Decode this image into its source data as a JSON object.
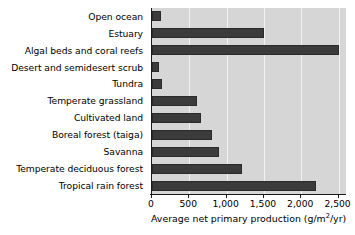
{
  "chart_data": {
    "type": "bar",
    "orientation": "horizontal",
    "title": "",
    "xlabel": "Average net primary production (g/m2/yr)",
    "ylabel": "",
    "categories": [
      "Open ocean",
      "Estuary",
      "Algal beds and coral reefs",
      "Desert and semidesert scrub",
      "Tundra",
      "Temperate grassland",
      "Cultivated land",
      "Boreal forest (taiga)",
      "Savanna",
      "Temperate deciduous forest",
      "Tropical rain forest"
    ],
    "values": [
      125,
      1500,
      2500,
      90,
      140,
      600,
      650,
      800,
      900,
      1200,
      2200
    ],
    "xlim": [
      0,
      2600
    ],
    "xticks": [
      0,
      500,
      1000,
      1500,
      2000,
      2500
    ],
    "xticklabels": [
      "0",
      "500",
      "1,000",
      "1,500",
      "2,000",
      "2,500"
    ],
    "grid": true,
    "legend": null,
    "bar_color": "#3b3b3b",
    "plot_background": "#d6d6d6",
    "gridline_color": "#f2f2f2"
  },
  "axis": {
    "title_prefix": "Average net primary production (g/m",
    "title_sup": "2",
    "title_suffix": "/yr)"
  }
}
